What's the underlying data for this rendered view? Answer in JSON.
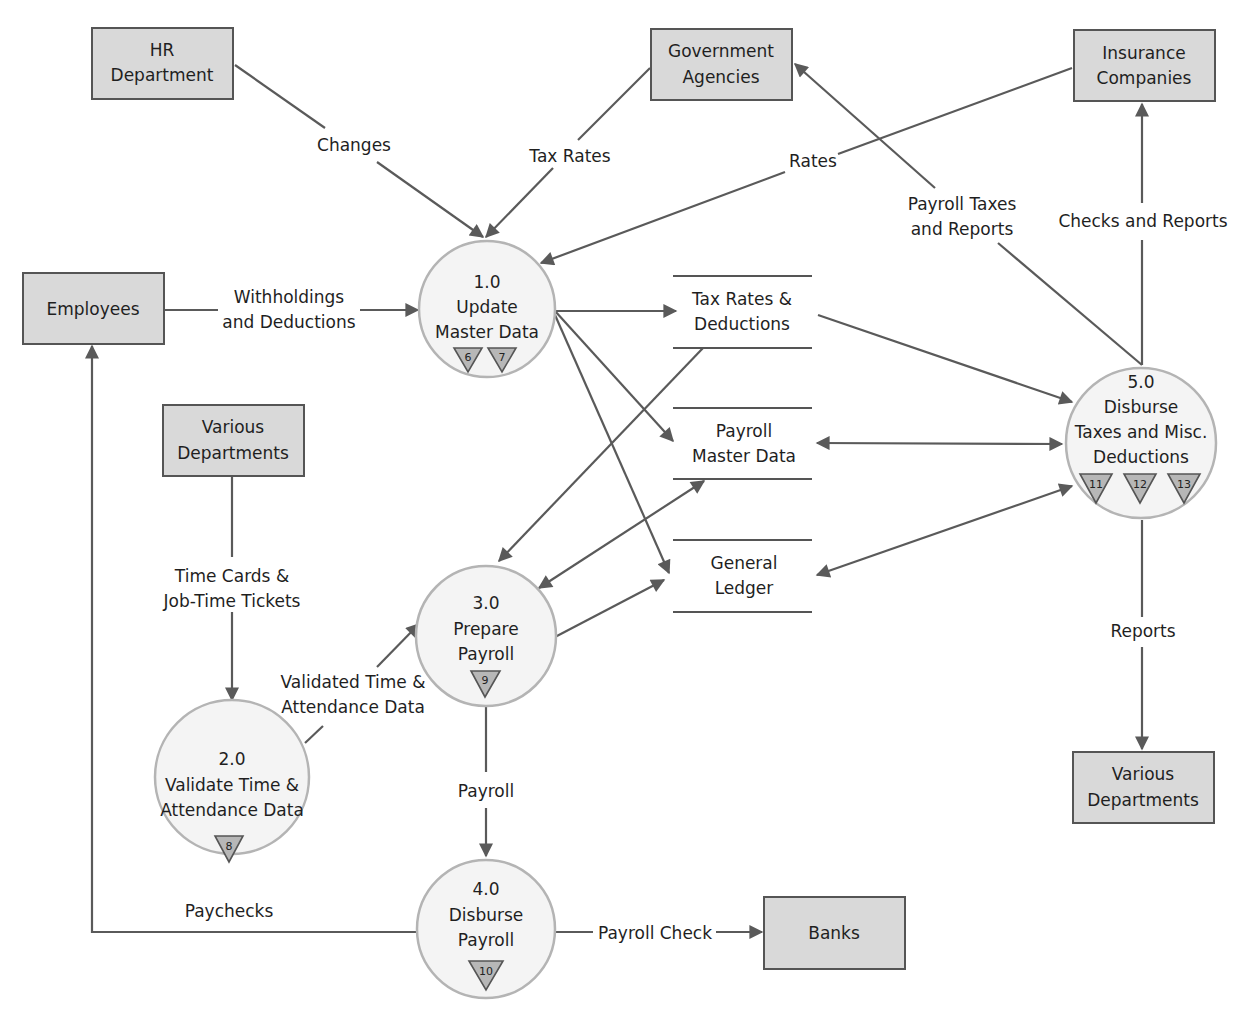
{
  "diagram": {
    "type": "data-flow-diagram",
    "entities": {
      "hr_department": {
        "line1": "HR",
        "line2": "Department"
      },
      "government_agencies": {
        "line1": "Government",
        "line2": "Agencies"
      },
      "insurance_companies": {
        "line1": "Insurance",
        "line2": "Companies"
      },
      "employees": {
        "line1": "Employees"
      },
      "various_departments_in": {
        "line1": "Various",
        "line2": "Departments"
      },
      "various_departments_out": {
        "line1": "Various",
        "line2": "Departments"
      },
      "banks": {
        "line1": "Banks"
      }
    },
    "processes": {
      "p1": {
        "number": "1.0",
        "line1": "Update",
        "line2": "Master Data",
        "refs": [
          "6",
          "7"
        ]
      },
      "p2": {
        "number": "2.0",
        "line1": "Validate Time &",
        "line2": "Attendance Data",
        "refs": [
          "8"
        ]
      },
      "p3": {
        "number": "3.0",
        "line1": "Prepare",
        "line2": "Payroll",
        "refs": [
          "9"
        ]
      },
      "p4": {
        "number": "4.0",
        "line1": "Disburse",
        "line2": "Payroll",
        "refs": [
          "10"
        ]
      },
      "p5": {
        "number": "5.0",
        "line1": "Disburse",
        "line2": "Taxes and Misc.",
        "line3": "Deductions",
        "refs": [
          "11",
          "12",
          "13"
        ]
      }
    },
    "data_stores": {
      "tax_rates": {
        "line1": "Tax Rates &",
        "line2": "Deductions"
      },
      "payroll_master": {
        "line1": "Payroll",
        "line2": "Master Data"
      },
      "general_ledger": {
        "line1": "General",
        "line2": "Ledger"
      }
    },
    "flows": {
      "changes": {
        "line1": "Changes"
      },
      "tax_rates": {
        "line1": "Tax Rates"
      },
      "rates": {
        "line1": "Rates"
      },
      "payroll_taxes": {
        "line1": "Payroll Taxes",
        "line2": "and Reports"
      },
      "checks_reports": {
        "line1": "Checks and Reports"
      },
      "withholdings": {
        "line1": "Withholdings",
        "line2": "and Deductions"
      },
      "time_cards": {
        "line1": "Time Cards &",
        "line2": "Job-Time Tickets"
      },
      "validated": {
        "line1": "Validated Time &",
        "line2": "Attendance Data"
      },
      "payroll": {
        "line1": "Payroll"
      },
      "paychecks": {
        "line1": "Paychecks"
      },
      "payroll_check": {
        "line1": "Payroll Check"
      },
      "reports": {
        "line1": "Reports"
      }
    },
    "colors": {
      "entity_fill": "#d9d9d9",
      "process_fill": "#f4f4f4",
      "process_stroke": "#b4b4b4",
      "line": "#5a5a5a",
      "ref_triangle": "#b7b7b7"
    }
  }
}
